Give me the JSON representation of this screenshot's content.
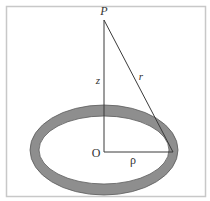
{
  "diagram": {
    "labels": {
      "point": "P",
      "axis_distance": "z",
      "slant_distance": "r",
      "origin": "O",
      "radius": "ρ"
    },
    "colors": {
      "ring_fill": "#8e8e8e",
      "ring_stroke": "#5a5a5a",
      "line": "#3a3a3a",
      "frame": "#c8c8c8",
      "background": "#ffffff"
    }
  }
}
